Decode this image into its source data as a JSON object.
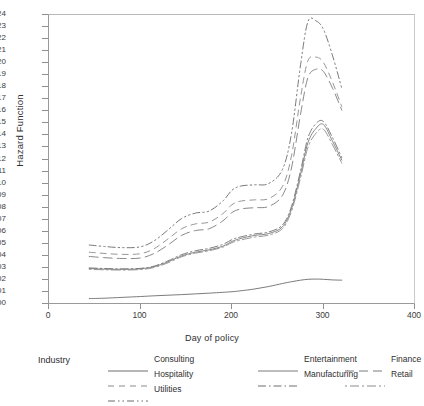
{
  "chart_data": {
    "type": "line",
    "title": "",
    "xlabel": "Day of policy",
    "ylabel": "Hazard Function",
    "xlim": [
      0,
      400
    ],
    "ylim": [
      0.0,
      0.024
    ],
    "xticks": [
      0,
      100,
      200,
      300,
      400
    ],
    "yticks": [
      "0.000",
      "0.001",
      "0.002",
      "0.003",
      "0.004",
      "0.005",
      "0.006",
      "0.007",
      "0.008",
      "0.009",
      "0.010",
      "0.011",
      "0.012",
      "0.013",
      "0.014",
      "0.015",
      "0.016",
      "0.017",
      "0.018",
      "0.019",
      "0.020",
      "0.021",
      "0.022",
      "0.023",
      "0.024"
    ],
    "grid": false,
    "legend_position": "bottom",
    "legend_title": "Industry",
    "x": [
      44,
      60,
      80,
      100,
      115,
      130,
      145,
      160,
      175,
      190,
      200,
      210,
      225,
      240,
      255,
      265,
      275,
      283,
      292,
      300,
      310,
      320
    ],
    "series": [
      {
        "name": "Consulting",
        "dash": "solid",
        "color": "#6c6c6c",
        "values": [
          0.00045,
          0.00048,
          0.00055,
          0.00062,
          0.00068,
          0.00073,
          0.00078,
          0.00084,
          0.0009,
          0.00097,
          0.00102,
          0.0011,
          0.00125,
          0.00145,
          0.0017,
          0.00185,
          0.00198,
          0.00205,
          0.00207,
          0.00205,
          0.002,
          0.00198
        ]
      },
      {
        "name": "Entertainment",
        "dash": "solid",
        "color": "#7a7a7a",
        "values": [
          0.00295,
          0.0029,
          0.00288,
          0.00292,
          0.0031,
          0.0035,
          0.004,
          0.0043,
          0.0045,
          0.0048,
          0.0052,
          0.00545,
          0.0057,
          0.00585,
          0.0064,
          0.0079,
          0.0108,
          0.0134,
          0.0146,
          0.0149,
          0.0135,
          0.01195
        ]
      },
      {
        "name": "Finance",
        "dash": "longdash",
        "color": "#7a7a7a",
        "values": [
          0.00395,
          0.00385,
          0.00378,
          0.00382,
          0.0042,
          0.0049,
          0.0057,
          0.0061,
          0.00625,
          0.0069,
          0.0076,
          0.0079,
          0.008,
          0.0081,
          0.009,
          0.0113,
          0.0158,
          0.0188,
          0.0195,
          0.0193,
          0.0179,
          0.0161
        ]
      },
      {
        "name": "Hospitality",
        "dash": "dashed",
        "color": "#8a8a8a",
        "values": [
          0.0043,
          0.0042,
          0.00412,
          0.00418,
          0.0046,
          0.0054,
          0.00625,
          0.00665,
          0.0068,
          0.0075,
          0.00825,
          0.00855,
          0.00865,
          0.00875,
          0.00975,
          0.0123,
          0.0172,
          0.0202,
          0.0205,
          0.02005,
          0.0184,
          0.0164
        ]
      },
      {
        "name": "Manufacturing",
        "dash": "dashdot",
        "color": "#6f6f6f",
        "values": [
          0.003,
          0.00295,
          0.00292,
          0.00296,
          0.00315,
          0.00358,
          0.0041,
          0.00442,
          0.00462,
          0.00495,
          0.00535,
          0.00558,
          0.00582,
          0.00598,
          0.00655,
          0.0081,
          0.0111,
          0.0138,
          0.015,
          0.01515,
          0.0138,
          0.01215
        ]
      },
      {
        "name": "Retail",
        "dash": "dashdotshort",
        "color": "#8c8c8c",
        "values": [
          0.00288,
          0.00284,
          0.00282,
          0.00286,
          0.00303,
          0.00342,
          0.00392,
          0.00422,
          0.00442,
          0.00472,
          0.0051,
          0.00532,
          0.00556,
          0.00572,
          0.00625,
          0.0077,
          0.0105,
          0.013,
          0.0142,
          0.0145,
          0.0132,
          0.0117
        ]
      },
      {
        "name": "Utilities",
        "dash": "dashdotdot",
        "color": "#6a6a6a",
        "values": [
          0.0049,
          0.00478,
          0.00468,
          0.00475,
          0.00525,
          0.00615,
          0.0071,
          0.00755,
          0.00772,
          0.00855,
          0.00945,
          0.0098,
          0.0099,
          0.01,
          0.01115,
          0.01415,
          0.0199,
          0.02345,
          0.0235,
          0.0228,
          0.0206,
          0.0179
        ]
      }
    ]
  },
  "legend": {
    "title": "Industry",
    "columns": [
      {
        "items": [
          "Consulting",
          "Hospitality",
          "Utilities"
        ]
      },
      {
        "items": [
          "Entertainment",
          "Manufacturing"
        ]
      },
      {
        "items": [
          "Finance",
          "Retail"
        ]
      }
    ]
  }
}
